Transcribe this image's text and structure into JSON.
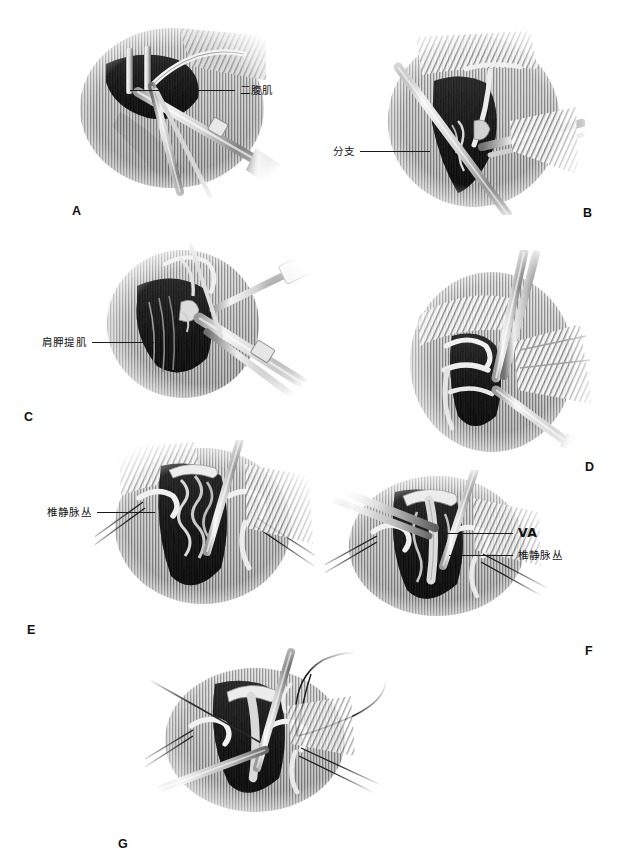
{
  "figure": {
    "style": "grayscale pen-and-ink medical illustration",
    "panel_count": 7,
    "background_color": "#ffffff",
    "ink_color": "#111111"
  },
  "panels": [
    {
      "id": "A",
      "letter": "A",
      "letter_x": 72,
      "letter_y": 205,
      "art_x": 60,
      "art_y": 20,
      "art_w": 230,
      "art_h": 180,
      "labels": [
        {
          "name": "digastric-muscle",
          "text": "二腹肌",
          "script": "cjk",
          "side": "right",
          "x": 130,
          "y": 85,
          "leader_len": 105
        }
      ]
    },
    {
      "id": "B",
      "letter": "B",
      "letter_x": 583,
      "letter_y": 207,
      "art_x": 370,
      "art_y": 25,
      "art_w": 215,
      "art_h": 190,
      "labels": [
        {
          "name": "branch",
          "text": "分支",
          "script": "cjk",
          "side": "left",
          "x": 333,
          "y": 146,
          "leader_len": 70
        }
      ]
    },
    {
      "id": "C",
      "letter": "C",
      "letter_x": 24,
      "letter_y": 411,
      "art_x": 95,
      "art_y": 240,
      "art_w": 225,
      "art_h": 170,
      "labels": [
        {
          "name": "levator-scapulae-muscle",
          "text": "肩胛提肌",
          "script": "cjk",
          "side": "left",
          "x": 42,
          "y": 337,
          "leader_len": 62
        }
      ]
    },
    {
      "id": "D",
      "letter": "D",
      "letter_x": 585,
      "letter_y": 461,
      "art_x": 400,
      "art_y": 250,
      "art_w": 195,
      "art_h": 215,
      "labels": []
    },
    {
      "id": "E",
      "letter": "E",
      "letter_x": 27,
      "letter_y": 624,
      "art_x": 95,
      "art_y": 440,
      "art_w": 220,
      "art_h": 175,
      "labels": [
        {
          "name": "vertebral-venous-plexus",
          "text": "椎静脉丛",
          "script": "cjk",
          "side": "left",
          "x": 47,
          "y": 507,
          "leader_len": 58
        }
      ]
    },
    {
      "id": "F",
      "letter": "F",
      "letter_x": 585,
      "letter_y": 645,
      "art_x": 325,
      "art_y": 470,
      "art_w": 225,
      "art_h": 155,
      "labels": [
        {
          "name": "vertebral-artery",
          "text": "VA",
          "script": "latin",
          "side": "right",
          "x": 441,
          "y": 527,
          "leader_len": 72
        },
        {
          "name": "vertebral-venous-plexus",
          "text": "椎静脉丛",
          "script": "cjk",
          "side": "right",
          "x": 449,
          "y": 550,
          "leader_len": 64
        }
      ]
    },
    {
      "id": "G",
      "letter": "G",
      "letter_x": 118,
      "letter_y": 838,
      "art_x": 145,
      "art_y": 640,
      "art_w": 245,
      "art_h": 180,
      "labels": []
    }
  ]
}
